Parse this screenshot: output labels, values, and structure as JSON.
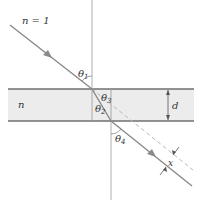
{
  "diagram": {
    "type": "refraction through parallel slab",
    "labels": {
      "outer_medium": "n = 1",
      "slab_medium": "n",
      "theta1": "θ",
      "theta1_sub": "1",
      "theta2": "θ",
      "theta2_sub": "2",
      "theta3": "θ",
      "theta3_sub": "3",
      "theta4": "θ",
      "theta4_sub": "4",
      "thickness": "d",
      "displacement": "x"
    },
    "colors": {
      "slab_fill": "#ececec",
      "slab_edge": "#6f6f6f",
      "ray": "#8a8a8a",
      "normal": "#9a9a9a",
      "dashed": "#b8b8b8",
      "text": "#333333"
    }
  }
}
